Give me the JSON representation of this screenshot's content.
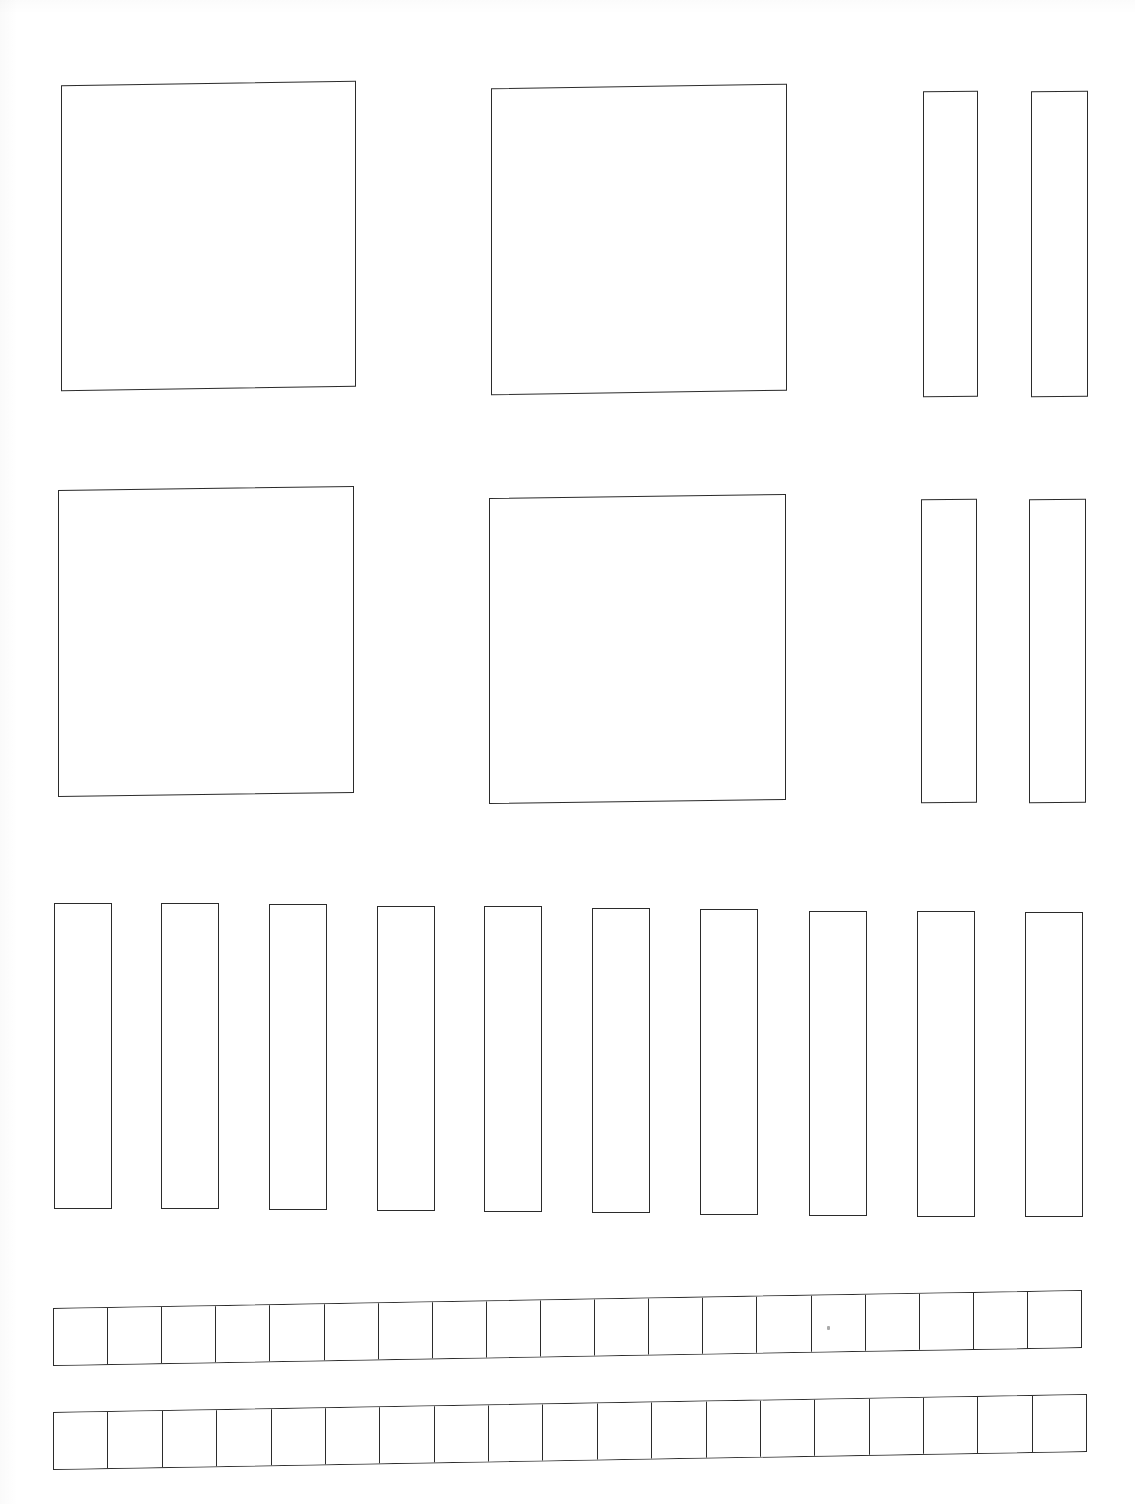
{
  "page": {
    "kind": "scanned-worksheet",
    "title": "",
    "background_color": "#ffffff",
    "ink_color": "#2b2b2b",
    "width": 1135,
    "height": 1504,
    "visible_text": []
  },
  "figures": {
    "description": "Blank outlined place-value / base-ten block figures arranged in four rows",
    "rows": [
      {
        "name": "row-1",
        "items": [
          {
            "name": "flat-large-left",
            "type": "square",
            "x": 61,
            "y": 83,
            "w": 295,
            "h": 306,
            "skew": -0.9
          },
          {
            "name": "flat-large-right",
            "type": "square",
            "x": 491,
            "y": 86,
            "w": 296,
            "h": 307,
            "skew": -0.9
          },
          {
            "name": "rod-tall-1",
            "type": "rectangle",
            "x": 923,
            "y": 91,
            "w": 55,
            "h": 306,
            "skew": -0.3
          },
          {
            "name": "rod-tall-2",
            "type": "rectangle",
            "x": 1031,
            "y": 91,
            "w": 57,
            "h": 306,
            "skew": -0.3
          }
        ]
      },
      {
        "name": "row-2",
        "items": [
          {
            "name": "flat-large-left",
            "type": "square",
            "x": 58,
            "y": 488,
            "w": 296,
            "h": 307,
            "skew": -0.8
          },
          {
            "name": "flat-large-right",
            "type": "square",
            "x": 489,
            "y": 496,
            "w": 297,
            "h": 306,
            "skew": -0.8
          },
          {
            "name": "rod-tall-1",
            "type": "rectangle",
            "x": 921,
            "y": 499,
            "w": 56,
            "h": 304,
            "skew": -0.3
          },
          {
            "name": "rod-tall-2",
            "type": "rectangle",
            "x": 1029,
            "y": 499,
            "w": 57,
            "h": 304,
            "skew": -0.3
          }
        ]
      },
      {
        "name": "row-3",
        "count": 10,
        "items": [
          {
            "name": "rod-1",
            "type": "rectangle",
            "x": 54,
            "y": 903,
            "w": 58,
            "h": 306,
            "skew": -0.2
          },
          {
            "name": "rod-2",
            "type": "rectangle",
            "x": 161,
            "y": 903,
            "w": 58,
            "h": 306,
            "skew": -0.2
          },
          {
            "name": "rod-3",
            "type": "rectangle",
            "x": 269,
            "y": 904,
            "w": 58,
            "h": 306,
            "skew": -0.2
          },
          {
            "name": "rod-4",
            "type": "rectangle",
            "x": 377,
            "y": 906,
            "w": 58,
            "h": 305,
            "skew": -0.2
          },
          {
            "name": "rod-5",
            "type": "rectangle",
            "x": 484,
            "y": 906,
            "w": 58,
            "h": 306,
            "skew": -0.2
          },
          {
            "name": "rod-6",
            "type": "rectangle",
            "x": 592,
            "y": 908,
            "w": 58,
            "h": 305,
            "skew": -0.2
          },
          {
            "name": "rod-7",
            "type": "rectangle",
            "x": 700,
            "y": 909,
            "w": 58,
            "h": 306,
            "skew": -0.2
          },
          {
            "name": "rod-8",
            "type": "rectangle",
            "x": 809,
            "y": 911,
            "w": 58,
            "h": 305,
            "skew": -0.2
          },
          {
            "name": "rod-9",
            "type": "rectangle",
            "x": 917,
            "y": 911,
            "w": 58,
            "h": 306,
            "skew": -0.2
          },
          {
            "name": "rod-10",
            "type": "rectangle",
            "x": 1025,
            "y": 912,
            "w": 58,
            "h": 305,
            "skew": -0.2
          }
        ]
      },
      {
        "name": "row-4",
        "items": [
          {
            "name": "unit-strip-1",
            "type": "strip",
            "x": 53,
            "y": 1299,
            "w": 1029,
            "h": 58,
            "cells": 19,
            "skew": -1.0
          },
          {
            "name": "unit-strip-2",
            "type": "strip",
            "x": 53,
            "y": 1403,
            "w": 1034,
            "h": 58,
            "cells": 19,
            "skew": -1.0
          }
        ]
      }
    ],
    "artifacts": [
      {
        "name": "scan-speck",
        "x": 827,
        "y": 1326
      }
    ]
  }
}
